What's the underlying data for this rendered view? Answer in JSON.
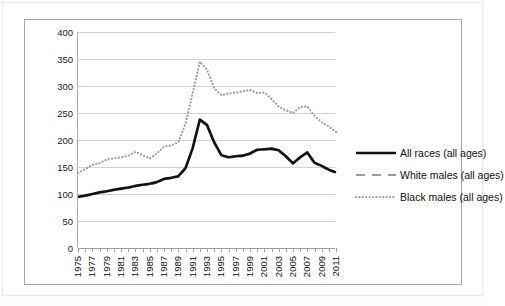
{
  "chart_data": {
    "type": "line",
    "title": "",
    "subtitle": "",
    "xlabel": "",
    "ylabel": "",
    "ylim": [
      0,
      400
    ],
    "ytick_step": 50,
    "yticks": [
      "0",
      "50",
      "100",
      "150",
      "200",
      "250",
      "300",
      "350",
      "400"
    ],
    "grid": true,
    "legend_position": "right",
    "x": [
      1975,
      1976,
      1977,
      1978,
      1979,
      1980,
      1981,
      1982,
      1983,
      1984,
      1985,
      1986,
      1987,
      1988,
      1989,
      1990,
      1991,
      1992,
      1993,
      1994,
      1995,
      1996,
      1997,
      1998,
      1999,
      2000,
      2001,
      2002,
      2003,
      2004,
      2005,
      2006,
      2007,
      2008,
      2009,
      2010,
      2011
    ],
    "xtick_labels": [
      "1975",
      "1977",
      "1979",
      "1981",
      "1983",
      "1985",
      "1987",
      "1989",
      "1991",
      "1993",
      "1995",
      "1997",
      "1999",
      "2001",
      "2003",
      "2005",
      "2007",
      "2009",
      "2011"
    ],
    "xlim": [
      1975,
      2011
    ],
    "series": [
      {
        "name": "All races (all ages)",
        "style": "solid",
        "color": "#111111",
        "width": 2.6,
        "values": [
          95,
          97,
          100,
          103,
          105,
          108,
          110,
          112,
          115,
          117,
          119,
          122,
          128,
          130,
          133,
          148,
          185,
          238,
          228,
          196,
          172,
          168,
          170,
          171,
          175,
          182,
          183,
          184,
          181,
          170,
          157,
          168,
          177,
          158,
          152,
          145,
          140
        ]
      },
      {
        "name": "White males (all ages)",
        "style": "dashed",
        "color": "#9b9b9b",
        "width": 2.2,
        "values": [
          94,
          96,
          99,
          102,
          104,
          107,
          109,
          111,
          114,
          116,
          118,
          121,
          127,
          129,
          132,
          147,
          184,
          236,
          226,
          194,
          171,
          167,
          169,
          170,
          174,
          181,
          182,
          183,
          180,
          169,
          156,
          167,
          176,
          157,
          151,
          144,
          139
        ]
      },
      {
        "name": "Black males (all ages)",
        "style": "dotted",
        "color": "#9b9b9b",
        "width": 2.2,
        "values": [
          139,
          146,
          154,
          157,
          164,
          166,
          168,
          171,
          178,
          172,
          166,
          175,
          188,
          190,
          196,
          230,
          287,
          345,
          330,
          296,
          283,
          286,
          288,
          290,
          293,
          287,
          288,
          276,
          262,
          255,
          250,
          261,
          262,
          245,
          233,
          225,
          215
        ]
      }
    ]
  },
  "legend": {
    "items": [
      {
        "label": "All races (all ages)"
      },
      {
        "label": "White males (all ages)"
      },
      {
        "label": "Black males (all ages)"
      }
    ]
  }
}
